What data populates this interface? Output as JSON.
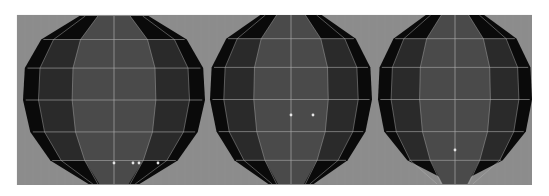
{
  "viewport": {
    "description": "3D modeling viewport showing three low-poly spheres in shaded wireframe mode",
    "background_color": "#8c8c8c",
    "grid_color": "#999999",
    "wire_color": "#b4b4b4",
    "silhouette_color": "#0a0a0a",
    "band_color": "#2a2a2a",
    "core_color": "#4a4a4a"
  },
  "objects": [
    {
      "name": "sphere-1",
      "label": "sphere",
      "shape": "rounded",
      "selected_vertices": 4
    },
    {
      "name": "sphere-2",
      "label": "sphere",
      "shape": "rounded",
      "selected_vertices": 2
    },
    {
      "name": "sphere-3",
      "label": "sphere",
      "shape": "pointed-bottom",
      "selected_vertices": 1
    }
  ]
}
